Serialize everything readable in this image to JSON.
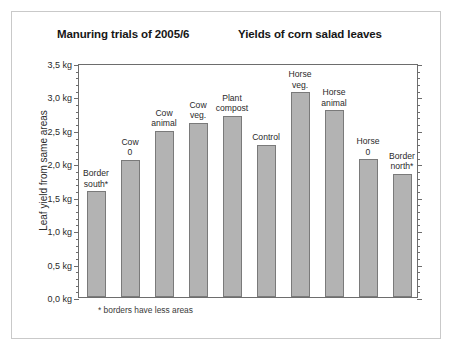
{
  "figure": {
    "title_left": "Manuring trials of 2005/6",
    "title_right": "Yields of corn salad leaves",
    "footnote": "* borders have less areas",
    "bar_fill_color": "#b3b3b3",
    "bar_border_color": "#7a7a7a",
    "axis_color": "#6d6d6d",
    "background_color": "#ffffff"
  },
  "chart_data": {
    "type": "bar",
    "title": "Manuring trials of 2005/6    Yields of corn salad leaves",
    "xlabel": "",
    "ylabel": "Leaf yield from same areas",
    "ylim": [
      0.0,
      3.5
    ],
    "ytick_step": 0.5,
    "yminor_step": 0.1,
    "yunit": "kg",
    "grid": false,
    "legend": "none",
    "ytick_labels": [
      "0,0 kg",
      "0,5 kg",
      "1,0 kg",
      "1,5 kg",
      "2,0 kg",
      "2,5 kg",
      "3,0 kg",
      "3,5 kg"
    ],
    "ytick_values": [
      0.0,
      0.5,
      1.0,
      1.5,
      2.0,
      2.5,
      3.0,
      3.5
    ],
    "categories": [
      "Border south*",
      "Cow 0",
      "Cow animal",
      "Cow veg.",
      "Plant compost",
      "Control",
      "Horse veg.",
      "Horse animal",
      "Horse 0",
      "Border north*"
    ],
    "category_labels": [
      "Border\nsouth*",
      "Cow\n0",
      "Cow\nanimal",
      "Cow\nveg.",
      "Plant\ncompost",
      "Control",
      "Horse\nveg.",
      "Horse\nanimal",
      "Horse\n0",
      "Border\nnorth*"
    ],
    "values": [
      1.58,
      2.05,
      2.49,
      2.61,
      2.71,
      2.28,
      3.06,
      2.79,
      2.06,
      1.84
    ],
    "annotations": [
      "* borders have less areas"
    ]
  }
}
